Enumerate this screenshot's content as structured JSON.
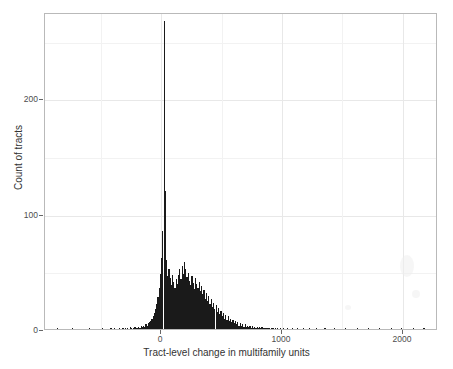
{
  "chart_data": {
    "type": "bar",
    "subtype": "histogram",
    "title": "",
    "xlabel": "Tract-level change in multifamily units",
    "ylabel": "Count of tracts",
    "xlim": [
      -960,
      2290
    ],
    "ylim": [
      0,
      275
    ],
    "xticks": [
      0,
      1000,
      2000
    ],
    "xticklabels": [
      "0",
      "1000",
      "2000"
    ],
    "yticks": [
      0,
      100,
      200
    ],
    "yticklabels": [
      "0",
      "100",
      "200"
    ],
    "grid": true,
    "grid_major_color": "#e8e8e8",
    "grid_minor_color": "#f2f2f2",
    "bar_color": "#1a1a1a",
    "panel_background": "#ffffff",
    "panel_border_color": "#b9b9b9",
    "legend": null,
    "bin_width": 10,
    "x_bin_centers": [
      -955,
      -945,
      -935,
      -925,
      -915,
      -905,
      -895,
      -885,
      -875,
      -865,
      -855,
      -845,
      -835,
      -825,
      -815,
      -805,
      -795,
      -785,
      -775,
      -765,
      -755,
      -745,
      -735,
      -725,
      -715,
      -705,
      -695,
      -685,
      -675,
      -665,
      -655,
      -645,
      -635,
      -625,
      -615,
      -605,
      -595,
      -585,
      -575,
      -565,
      -555,
      -545,
      -535,
      -525,
      -515,
      -505,
      -495,
      -485,
      -475,
      -465,
      -455,
      -445,
      -435,
      -425,
      -415,
      -405,
      -395,
      -385,
      -375,
      -365,
      -355,
      -345,
      -335,
      -325,
      -315,
      -305,
      -295,
      -285,
      -275,
      -265,
      -255,
      -245,
      -235,
      -225,
      -215,
      -205,
      -195,
      -185,
      -175,
      -165,
      -155,
      -145,
      -135,
      -125,
      -115,
      -105,
      -95,
      -85,
      -75,
      -65,
      -55,
      -45,
      -35,
      -25,
      -15,
      -5,
      5,
      15,
      25,
      35,
      45,
      55,
      65,
      75,
      85,
      95,
      105,
      115,
      125,
      135,
      145,
      155,
      165,
      175,
      185,
      195,
      205,
      215,
      225,
      235,
      245,
      255,
      265,
      275,
      285,
      295,
      305,
      315,
      325,
      335,
      345,
      355,
      365,
      375,
      385,
      395,
      405,
      415,
      425,
      435,
      445,
      455,
      465,
      475,
      485,
      495,
      505,
      515,
      525,
      535,
      545,
      555,
      565,
      575,
      585,
      595,
      605,
      615,
      625,
      635,
      645,
      655,
      665,
      675,
      685,
      695,
      705,
      715,
      725,
      735,
      745,
      755,
      765,
      775,
      785,
      795,
      805,
      815,
      825,
      835,
      845,
      855,
      865,
      875,
      885,
      895,
      905,
      915,
      925,
      935,
      945,
      955,
      965,
      975,
      985,
      995,
      1005,
      1015,
      1025,
      1035,
      1045,
      1055,
      1065,
      1075,
      1085,
      1095,
      1105,
      1115,
      1125,
      1135,
      1145,
      1155,
      1165,
      1175,
      1185,
      1195,
      1205,
      1215,
      1225,
      1235,
      1245,
      1255,
      1265,
      1275,
      1285,
      1295,
      1305,
      1315,
      1325,
      1335,
      1345,
      1355,
      1365,
      1375,
      1385,
      1395,
      1405,
      1415,
      1425,
      1435,
      1445,
      1455,
      1465,
      1475,
      1485,
      1495,
      1505,
      1515,
      1525,
      1535,
      1545,
      1555,
      1565,
      1575,
      1585,
      1595,
      1605,
      1615,
      1625,
      1635,
      1645,
      1655,
      1665,
      1675,
      1685,
      1695,
      1705,
      1715,
      1725,
      1735,
      1745,
      1755,
      1765,
      1775,
      1785,
      1795,
      1805,
      1815,
      1825,
      1835,
      1845,
      1855,
      1865,
      1875,
      1885,
      1895,
      1905,
      1915,
      1925,
      1935,
      1945,
      1955,
      1965,
      1975,
      1985,
      1995,
      2005,
      2015,
      2025,
      2035,
      2045,
      2055,
      2065,
      2075,
      2085,
      2095,
      2105,
      2115,
      2125,
      2135,
      2145,
      2155,
      2165,
      2175,
      2185,
      2195,
      2205,
      2215,
      2225,
      2235,
      2245,
      2255,
      2265,
      2275,
      2285
    ],
    "counts": [
      0,
      0,
      0,
      0,
      0,
      0,
      0,
      0,
      0,
      0,
      1,
      0,
      0,
      0,
      0,
      0,
      0,
      0,
      0,
      0,
      0,
      0,
      1,
      0,
      0,
      0,
      0,
      0,
      0,
      0,
      0,
      0,
      0,
      0,
      0,
      0,
      1,
      0,
      0,
      0,
      0,
      0,
      0,
      0,
      0,
      0,
      0,
      1,
      0,
      0,
      0,
      0,
      0,
      0,
      1,
      0,
      0,
      1,
      0,
      0,
      0,
      1,
      0,
      0,
      1,
      0,
      1,
      0,
      1,
      0,
      2,
      1,
      0,
      1,
      2,
      1,
      1,
      2,
      1,
      3,
      2,
      3,
      2,
      4,
      3,
      5,
      6,
      7,
      9,
      11,
      14,
      17,
      22,
      28,
      36,
      48,
      62,
      85,
      267,
      120,
      60,
      46,
      52,
      44,
      38,
      47,
      41,
      36,
      43,
      39,
      47,
      52,
      43,
      55,
      48,
      58,
      52,
      45,
      49,
      42,
      38,
      46,
      40,
      35,
      44,
      39,
      36,
      41,
      33,
      37,
      30,
      34,
      26,
      31,
      24,
      29,
      22,
      26,
      19,
      23,
      17,
      21,
      15,
      18,
      13,
      16,
      11,
      14,
      9,
      12,
      8,
      11,
      7,
      9,
      6,
      8,
      5,
      7,
      4,
      6,
      3,
      5,
      3,
      4,
      2,
      4,
      2,
      3,
      2,
      3,
      1,
      3,
      1,
      2,
      1,
      2,
      1,
      2,
      1,
      2,
      1,
      1,
      1,
      1,
      1,
      1,
      0,
      1,
      1,
      0,
      1,
      0,
      1,
      0,
      1,
      0,
      0,
      1,
      0,
      0,
      1,
      0,
      0,
      0,
      1,
      0,
      0,
      0,
      1,
      0,
      0,
      0,
      0,
      1,
      0,
      0,
      0,
      0,
      1,
      0,
      0,
      0,
      0,
      0,
      1,
      0,
      0,
      0,
      0,
      0,
      0,
      1,
      0,
      0,
      0,
      0,
      0,
      0,
      0,
      1,
      0,
      0,
      0,
      0,
      0,
      0,
      0,
      0,
      1,
      0,
      0,
      0,
      0,
      0,
      0,
      0,
      0,
      0,
      1,
      0,
      0,
      0,
      0,
      0,
      0,
      0,
      0,
      1,
      0,
      0,
      0,
      0,
      0,
      0,
      0,
      0,
      1,
      0,
      0,
      0,
      0,
      0,
      0,
      0,
      0,
      0,
      1,
      0,
      0,
      0,
      0,
      0,
      0,
      0,
      1,
      0,
      0,
      0,
      0,
      0,
      0,
      0,
      0,
      0,
      1,
      0,
      0,
      0,
      0,
      0,
      0,
      0,
      0,
      1,
      0,
      0,
      0,
      0,
      0,
      0,
      0,
      0,
      0,
      1,
      0,
      0,
      0,
      0,
      0,
      0,
      1
    ],
    "peak": {
      "x": 0,
      "count": 267
    }
  },
  "axes": {
    "x": {
      "label": "Tract-level change in multifamily units",
      "ticks": [
        {
          "value": 0,
          "label": "0"
        },
        {
          "value": 1000,
          "label": "1000"
        },
        {
          "value": 2000,
          "label": "2000"
        }
      ]
    },
    "y": {
      "label": "Count of tracts",
      "ticks": [
        {
          "value": 0,
          "label": "0"
        },
        {
          "value": 100,
          "label": "100"
        },
        {
          "value": 200,
          "label": "200"
        }
      ]
    }
  }
}
